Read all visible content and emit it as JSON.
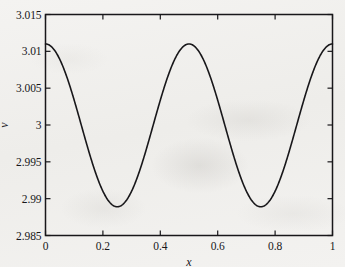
{
  "figure": {
    "background_color": "#f2f1ef",
    "ink_color": "#18171a"
  },
  "axes": {
    "x_title": "x",
    "y_title": "v",
    "x_ticks": [
      "0",
      "0.2",
      "0.4",
      "0.6",
      "0.8",
      "1"
    ],
    "y_ticks": [
      "2.985",
      "2.99",
      "2.995",
      "3",
      "3.005",
      "3.01",
      "3.015"
    ]
  },
  "chart_data": {
    "type": "line",
    "title": "",
    "xlabel": "x",
    "ylabel": "v",
    "xlim": [
      0,
      1
    ],
    "ylim": [
      2.985,
      3.015
    ],
    "xticks": [
      0,
      0.2,
      0.4,
      0.6,
      0.8,
      1
    ],
    "yticks": [
      2.985,
      2.99,
      2.995,
      3,
      3.005,
      3.01,
      3.015
    ],
    "grid": false,
    "legend": null,
    "frame": "box",
    "tick_direction": "in",
    "approx_relation": "v = 3 + 0.011*cos(4*pi*x)",
    "extrema": {
      "maxima_x": [
        0,
        0.5,
        1
      ],
      "maxima_v": 3.011,
      "minima_x": [
        0.25,
        0.75
      ],
      "minima_v": 2.9889
    },
    "series": [
      {
        "name": "v(x)",
        "color": "#18171a",
        "linewidth": 1.6,
        "x": [
          0,
          0.02,
          0.04,
          0.06,
          0.08,
          0.1,
          0.12,
          0.14,
          0.16,
          0.18,
          0.2,
          0.22,
          0.24,
          0.26,
          0.28,
          0.3,
          0.32,
          0.34,
          0.36,
          0.38,
          0.4,
          0.42,
          0.44,
          0.46,
          0.48,
          0.5,
          0.52,
          0.54,
          0.56,
          0.58,
          0.6,
          0.62,
          0.64,
          0.66,
          0.68,
          0.7,
          0.72,
          0.74,
          0.76,
          0.78,
          0.8,
          0.82,
          0.84,
          0.86,
          0.88,
          0.9,
          0.92,
          0.94,
          0.96,
          0.98,
          1
        ],
        "values": [
          3.011,
          3.0108,
          3.0103,
          3.0094,
          3.0082,
          3.0067,
          3.0049,
          3.003,
          3.001,
          2.999,
          2.997,
          2.9951,
          2.9934,
          2.992,
          2.9907,
          2.9898,
          2.9892,
          2.9889,
          2.989,
          2.9894,
          2.9902,
          2.9913,
          2.9928,
          2.9946,
          2.9966,
          3.011,
          3.0108,
          3.0103,
          3.0094,
          3.0082,
          3.0067,
          3.0049,
          3.003,
          3.001,
          2.999,
          2.997,
          2.9951,
          2.9934,
          2.992,
          2.9907,
          2.9898,
          2.9892,
          2.9889,
          2.989,
          2.9894,
          2.9902,
          2.9913,
          2.9928,
          2.9946,
          2.9966,
          3.011
        ]
      }
    ]
  }
}
